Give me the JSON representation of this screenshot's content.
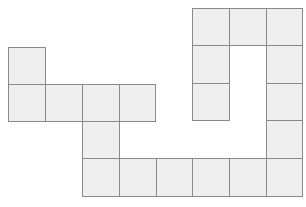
{
  "diagram": {
    "title": "",
    "cell_size": 37,
    "fill_color": "#efefef",
    "stroke_color": "#8a8a8a",
    "cells": [
      {
        "x": 8,
        "y": 47,
        "w": 38,
        "h": 38
      },
      {
        "x": 8,
        "y": 84,
        "w": 38,
        "h": 38
      },
      {
        "x": 45,
        "y": 84,
        "w": 38,
        "h": 38
      },
      {
        "x": 82,
        "y": 84,
        "w": 38,
        "h": 38
      },
      {
        "x": 119,
        "y": 84,
        "w": 37,
        "h": 38
      },
      {
        "x": 82,
        "y": 121,
        "w": 38,
        "h": 38
      },
      {
        "x": 82,
        "y": 158,
        "w": 38,
        "h": 39
      },
      {
        "x": 119,
        "y": 158,
        "w": 38,
        "h": 39
      },
      {
        "x": 156,
        "y": 158,
        "w": 37,
        "h": 39
      },
      {
        "x": 192,
        "y": 158,
        "w": 38,
        "h": 39
      },
      {
        "x": 229,
        "y": 158,
        "w": 38,
        "h": 39
      },
      {
        "x": 266,
        "y": 158,
        "w": 37,
        "h": 39
      },
      {
        "x": 266,
        "y": 120,
        "w": 37,
        "h": 39
      },
      {
        "x": 266,
        "y": 83,
        "w": 37,
        "h": 38
      },
      {
        "x": 266,
        "y": 45,
        "w": 37,
        "h": 39
      },
      {
        "x": 266,
        "y": 8,
        "w": 37,
        "h": 38
      },
      {
        "x": 229,
        "y": 8,
        "w": 38,
        "h": 38
      },
      {
        "x": 192,
        "y": 8,
        "w": 38,
        "h": 38
      },
      {
        "x": 192,
        "y": 45,
        "w": 38,
        "h": 39
      },
      {
        "x": 192,
        "y": 83,
        "w": 38,
        "h": 38
      }
    ]
  }
}
